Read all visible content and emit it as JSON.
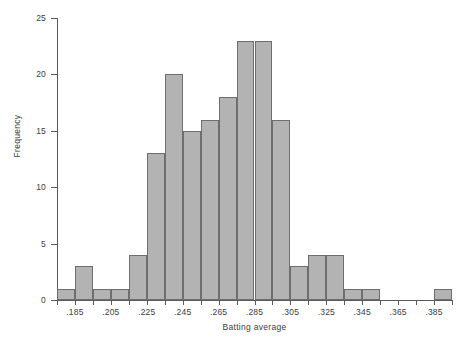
{
  "chart_data": {
    "type": "bar",
    "title": "",
    "xlabel": "Batting average",
    "ylabel": "Frequency",
    "xlim": [
      0.175,
      0.395
    ],
    "ylim": [
      0,
      25
    ],
    "bin_width": 0.01,
    "grid": false,
    "legend": null,
    "bar_fill": "#b3b3b3",
    "bar_stroke": "#6e6e6e",
    "y_ticks": [
      0,
      5,
      10,
      15,
      20,
      25
    ],
    "y_tick_labels": [
      "0",
      "5",
      "10",
      "15",
      "20",
      "25"
    ],
    "x_ticks": [
      0.175,
      0.185,
      0.195,
      0.205,
      0.215,
      0.225,
      0.235,
      0.245,
      0.255,
      0.265,
      0.275,
      0.285,
      0.295,
      0.305,
      0.315,
      0.325,
      0.335,
      0.345,
      0.355,
      0.365,
      0.375,
      0.385,
      0.395
    ],
    "x_tick_labels": [
      ".185",
      ".205",
      ".225",
      ".245",
      ".265",
      ".285",
      ".305",
      ".325",
      ".345",
      ".365",
      ".385"
    ],
    "x_tick_label_positions": [
      0.185,
      0.205,
      0.225,
      0.245,
      0.265,
      0.285,
      0.305,
      0.325,
      0.345,
      0.365,
      0.385
    ],
    "categories": [
      "0.175-0.185",
      "0.185-0.195",
      "0.195-0.205",
      "0.205-0.215",
      "0.215-0.225",
      "0.225-0.235",
      "0.235-0.245",
      "0.245-0.255",
      "0.255-0.265",
      "0.265-0.275",
      "0.275-0.285",
      "0.285-0.295",
      "0.295-0.305",
      "0.305-0.315",
      "0.315-0.325",
      "0.325-0.335",
      "0.335-0.345",
      "0.345-0.355",
      "0.355-0.365",
      "0.365-0.375",
      "0.375-0.385",
      "0.385-0.395"
    ],
    "bin_starts": [
      0.175,
      0.185,
      0.195,
      0.205,
      0.215,
      0.225,
      0.235,
      0.245,
      0.255,
      0.265,
      0.275,
      0.285,
      0.295,
      0.305,
      0.315,
      0.325,
      0.335,
      0.345,
      0.355,
      0.365,
      0.375,
      0.385
    ],
    "values": [
      1,
      3,
      1,
      1,
      4,
      13,
      20,
      15,
      16,
      18,
      23,
      23,
      16,
      3,
      4,
      4,
      1,
      1,
      0,
      0,
      0,
      1
    ]
  }
}
